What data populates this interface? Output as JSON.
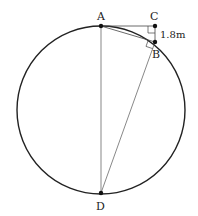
{
  "diagram": {
    "points": {
      "A": {
        "label": "A",
        "x": 101,
        "y": 26
      },
      "B": {
        "label": "B",
        "x": 155,
        "y": 42
      },
      "C": {
        "label": "C",
        "x": 155,
        "y": 26
      },
      "D": {
        "label": "D",
        "x": 101,
        "y": 193
      }
    },
    "circle": {
      "cx": 101,
      "cy": 110,
      "r": 84
    },
    "measurement": {
      "segment": "CB",
      "text": "1.8m"
    },
    "right_angles": [
      "C",
      "B"
    ],
    "colors": {
      "stroke": "#222222",
      "thin": "#555555"
    }
  }
}
